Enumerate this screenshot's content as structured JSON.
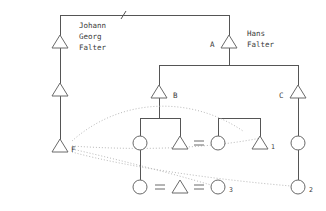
{
  "diagram": {
    "kind": "kinship-pedigree-chart",
    "canvas": {
      "width": 326,
      "height": 211,
      "background": "#ffffff"
    },
    "palette": {
      "line": "#555555",
      "glyph_stroke": "#6a6a6a",
      "dotted_link": "#b9b9b9",
      "text": "#3a3a3a"
    }
  },
  "persons": {
    "johann": {
      "id": "johann-georg-falter",
      "symbol": "triangle",
      "sex": "male",
      "name_lines": [
        "Johann",
        "Georg",
        "Falter"
      ],
      "name_line_1": "Johann",
      "name_line_2": "Georg",
      "name_line_3": "Falter",
      "code": "",
      "x": 60,
      "y": 42
    },
    "left_mid": {
      "id": "left-middle-male",
      "symbol": "triangle",
      "sex": "male",
      "code": "",
      "x": 60,
      "y": 90
    },
    "ego_f": {
      "id": "ego-f",
      "symbol": "triangle",
      "sex": "male",
      "code": "F",
      "x": 60,
      "y": 146
    },
    "hans": {
      "id": "hans-falter",
      "symbol": "triangle",
      "sex": "male",
      "code": "A",
      "name_lines": [
        "Hans",
        "Falter"
      ],
      "name_line_1": "Hans",
      "name_line_2": "Falter",
      "x": 229,
      "y": 42
    },
    "node_b": {
      "id": "node-b",
      "symbol": "triangle",
      "sex": "male",
      "code": "B",
      "x": 159,
      "y": 92
    },
    "node_c": {
      "id": "node-c",
      "symbol": "triangle",
      "sex": "male",
      "code": "C",
      "x": 298,
      "y": 92
    },
    "b_daughter": {
      "id": "b-daughter",
      "symbol": "circle",
      "sex": "female",
      "code": "",
      "x": 140,
      "y": 143
    },
    "b_son": {
      "id": "b-son",
      "symbol": "triangle",
      "sex": "male",
      "code": "",
      "x": 180,
      "y": 143
    },
    "spouse_circle": {
      "id": "spouse-female-of-b-son",
      "symbol": "circle",
      "sex": "female",
      "code": "",
      "x": 218,
      "y": 143
    },
    "male_1": {
      "id": "male-1",
      "symbol": "triangle",
      "sex": "male",
      "code": "1",
      "x": 260,
      "y": 143
    },
    "c_daughter": {
      "id": "c-daughter",
      "symbol": "circle",
      "sex": "female",
      "code": "",
      "x": 298,
      "y": 143
    },
    "bottom_left_circle": {
      "id": "bottom-left-female",
      "symbol": "circle",
      "sex": "female",
      "code": "",
      "x": 140,
      "y": 187
    },
    "bottom_male": {
      "id": "bottom-male",
      "symbol": "triangle",
      "sex": "male",
      "code": "",
      "x": 180,
      "y": 187
    },
    "female_3": {
      "id": "female-3",
      "symbol": "circle",
      "sex": "female",
      "code": "3",
      "x": 218,
      "y": 187
    },
    "female_2": {
      "id": "female-2",
      "symbol": "circle",
      "sex": "female",
      "code": "2",
      "x": 298,
      "y": 187
    }
  },
  "labels": {
    "a": "A",
    "b": "B",
    "c": "C",
    "f": "F",
    "one": "1",
    "two": "2",
    "three": "3",
    "johann_l1": "Johann",
    "johann_l2": "Georg",
    "johann_l3": "Falter",
    "hans_l1": "Hans",
    "hans_l2": "Falter"
  },
  "unions": [
    {
      "id": "union-b-son-spouse",
      "left": "b-son",
      "right": "spouse-female-of-b-son",
      "x": 199,
      "y": 143
    },
    {
      "id": "union-bottom-left",
      "left": "bottom-left-female",
      "right": "bottom-male",
      "x": 160,
      "y": 187
    },
    {
      "id": "union-bottom-right",
      "left": "bottom-male",
      "right": "female-3",
      "x": 199,
      "y": 187
    }
  ],
  "descent_links": [
    {
      "id": "top-sibling-bar",
      "from": "johann-georg-falter",
      "to": "hans-falter",
      "style": "solid"
    },
    {
      "id": "johann-to-left-mid",
      "from": "johann-georg-falter",
      "to": "left-middle-male",
      "style": "solid"
    },
    {
      "id": "left-mid-to-f",
      "from": "left-middle-male",
      "to": "ego-f",
      "style": "solid"
    },
    {
      "id": "hans-to-b-and-c",
      "from": "hans-falter",
      "to": "node-b,node-c",
      "style": "solid"
    },
    {
      "id": "b-to-children",
      "from": "node-b",
      "to": "b-daughter,b-son",
      "style": "solid"
    },
    {
      "id": "b-daughter-to-bottom",
      "from": "b-daughter",
      "to": "bottom-left-female",
      "style": "solid"
    },
    {
      "id": "union1-to-male-1",
      "from": "union-b-son-spouse",
      "to": "male-1",
      "style": "solid"
    },
    {
      "id": "c-to-daughter",
      "from": "node-c",
      "to": "c-daughter",
      "style": "solid"
    },
    {
      "id": "c-daughter-to-female-2",
      "from": "c-daughter",
      "to": "female-2",
      "style": "solid"
    }
  ],
  "reference_links": [
    {
      "id": "f-to-b-arc",
      "from": "ego-f",
      "to": "node-b",
      "style": "dotted-arc"
    },
    {
      "id": "f-to-male-1",
      "from": "ego-f",
      "to": "male-1",
      "style": "dotted"
    },
    {
      "id": "f-to-female-3",
      "from": "ego-f",
      "to": "female-3",
      "style": "dotted"
    },
    {
      "id": "f-to-female-2",
      "from": "ego-f",
      "to": "female-2",
      "style": "dotted"
    }
  ]
}
